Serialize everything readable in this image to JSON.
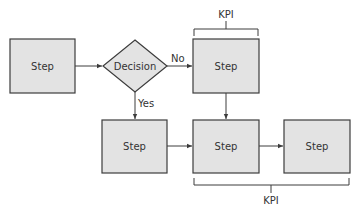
{
  "colors": {
    "box_fill": "#e3e3e3",
    "stroke": "#3c3c3c",
    "text": "#333333"
  },
  "nodes": {
    "step1": {
      "label": "Step"
    },
    "decision": {
      "label": "Decision"
    },
    "step_no": {
      "label": "Step"
    },
    "step_yes": {
      "label": "Step"
    },
    "step_merge": {
      "label": "Step"
    },
    "step_final": {
      "label": "Step"
    }
  },
  "edges": {
    "no_label": "No",
    "yes_label": "Yes"
  },
  "kpi": {
    "top_label": "KPI",
    "bottom_label": "KPI"
  }
}
